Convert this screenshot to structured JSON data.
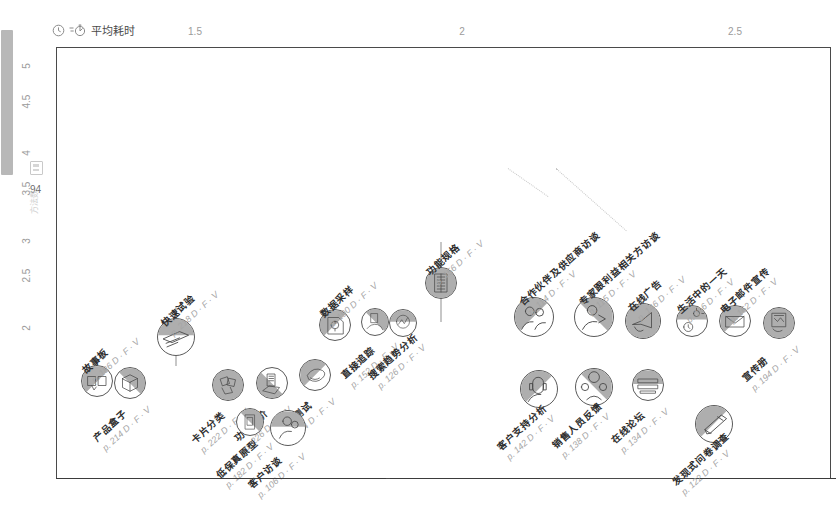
{
  "axes": {
    "x_title": "平均耗时",
    "x_title_icons": [
      "clock-icon",
      "stopwatch-icon"
    ],
    "x_ticks": [
      "1.5",
      "2",
      "2.5"
    ],
    "y_title": "证据强度",
    "y_title_icon": "strength-icon",
    "y_ticks": [
      "2",
      "2.5",
      "3",
      "3.5",
      "4",
      "4.5",
      "5"
    ],
    "y_count": "94",
    "y_count_icon": "card-count-icon",
    "y_sub": "方法数"
  },
  "chart_data": {
    "type": "scatter",
    "title": "",
    "xlabel": "平均耗时",
    "ylabel": "证据强度",
    "xlim": [
      1.25,
      2.75
    ],
    "ylim": [
      1.6,
      5.1
    ],
    "grid": false,
    "legend": "none",
    "points": [
      {
        "label": "故事板",
        "page": "p. 186",
        "tags": "D · F · V",
        "x": 1.4,
        "y": 2.12,
        "icon": "storyboard-icon",
        "err": 0
      },
      {
        "label": "产品盒子",
        "page": "p. 214",
        "tags": "D · F · V",
        "x": 1.52,
        "y": 2.1,
        "icon": "product-box-icon",
        "err": 0
      },
      {
        "label": "快速试验",
        "page": "p. 218",
        "tags": "D · F · V",
        "x": 1.69,
        "y": 2.53,
        "icon": "quick-experiment-icon",
        "err": 60
      },
      {
        "label": "卡片分类",
        "page": "p. 222",
        "tags": "D · F · V",
        "x": 1.88,
        "y": 2.08,
        "icon": "card-sorting-icon",
        "err": 0
      },
      {
        "label": "功能定价",
        "page": "p. 226",
        "tags": "D · F · V",
        "x": 2.04,
        "y": 2.1,
        "icon": "feature-pricing-icon",
        "err": 0
      },
      {
        "label": "竞品测试",
        "page": "p. 204",
        "tags": "D · F · V",
        "x": 2.2,
        "y": 2.18,
        "icon": "competitor-test-icon",
        "err": 0
      },
      {
        "label": "低保真原型",
        "page": "p. 182",
        "tags": "D · F · V",
        "x": 1.96,
        "y": 1.74,
        "icon": "lofi-prototype-icon",
        "err": 0
      },
      {
        "label": "客户访谈",
        "page": "p. 106",
        "tags": "D · F · V",
        "x": 2.1,
        "y": 1.68,
        "icon": "customer-interview-icon",
        "err": 0
      },
      {
        "label": "数据采样",
        "page": "p. 190",
        "tags": "D · F · V",
        "x": 2.27,
        "y": 2.64,
        "icon": "data-sampling-icon",
        "err": 0
      },
      {
        "label": "直接追踪",
        "page": "p. 152",
        "tags": "D · F · V",
        "x": 2.42,
        "y": 2.67,
        "icon": "direct-tracking-icon",
        "err": 0
      },
      {
        "label": "搜索趋势分析",
        "page": "p. 126",
        "tags": "D · F · V",
        "x": 2.52,
        "y": 2.66,
        "icon": "search-trend-icon",
        "err": 0
      },
      {
        "label": "功能规格",
        "page": "p. 156",
        "tags": "D · F · V",
        "x": 2.66,
        "y": 3.03,
        "icon": "spec-sheet-icon",
        "err": 80
      },
      {
        "label": "合作伙伴及供应商访谈",
        "page": "p. 114",
        "tags": "D · F · V",
        "x": 3.0,
        "y": 2.72,
        "icon": "partner-interview-icon",
        "err": 0
      },
      {
        "label": "专家跟利益相关方访谈",
        "page": "p. 115",
        "tags": "D · F · V",
        "x": 3.22,
        "y": 2.72,
        "icon": "expert-interview-icon",
        "err": 0
      },
      {
        "label": "在线广告",
        "page": "p. 146",
        "tags": "D · F · V",
        "x": 3.4,
        "y": 2.68,
        "icon": "online-ad-icon",
        "err": 0
      },
      {
        "label": "生活中的一天",
        "page": "p. 116",
        "tags": "D · F · V",
        "x": 3.58,
        "y": 2.68,
        "icon": "day-in-life-icon",
        "err": 0
      },
      {
        "label": "电子邮件宣传",
        "page": "p. 162",
        "tags": "D · F · V",
        "x": 3.74,
        "y": 2.68,
        "icon": "email-campaign-icon",
        "err": 0
      },
      {
        "label": "宣传册",
        "page": "p. 194",
        "tags": "D · F · V",
        "x": 3.9,
        "y": 2.66,
        "icon": "brochure-icon",
        "err": 0
      },
      {
        "label": "客户支持分析",
        "page": "p. 142",
        "tags": "D · F · V",
        "x": 3.02,
        "y": 2.05,
        "icon": "support-analysis-icon",
        "err": 0
      },
      {
        "label": "销售人员反馈",
        "page": "p. 138",
        "tags": "D · F · V",
        "x": 3.22,
        "y": 2.07,
        "icon": "sales-feedback-icon",
        "err": 0
      },
      {
        "label": "在线论坛",
        "page": "p. 134",
        "tags": "D · F · V",
        "x": 3.42,
        "y": 2.08,
        "icon": "online-forum-icon",
        "err": 0
      },
      {
        "label": "发现式问卷调查",
        "page": "p. 122",
        "tags": "D · F · V",
        "x": 3.66,
        "y": 1.72,
        "icon": "discovery-survey-icon",
        "err": 0
      }
    ]
  }
}
